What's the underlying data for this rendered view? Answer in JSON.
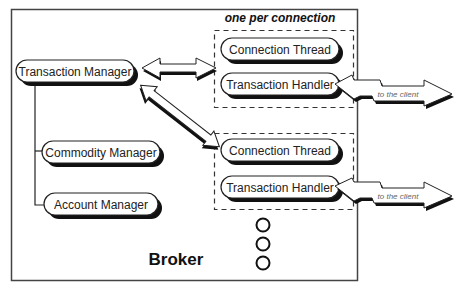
{
  "diagram": {
    "container": {
      "label": "Broker"
    },
    "group_label": "one per connection",
    "managers": [
      {
        "label": "Transaction Manager"
      },
      {
        "label": "Commodity Manager"
      },
      {
        "label": "Account Manager"
      }
    ],
    "connection_groups": [
      {
        "thread": "Connection Thread",
        "handler": "Transaction Handler",
        "client_arrow": "to the client"
      },
      {
        "thread": "Connection Thread",
        "handler": "Transaction Handler",
        "client_arrow": "to the client"
      }
    ],
    "ellipsis_count": 3,
    "edges": [
      {
        "from": "Transaction Manager",
        "to": "Connection Group 1",
        "type": "bidirectional"
      },
      {
        "from": "Transaction Manager",
        "to": "Connection Group 2",
        "type": "bidirectional"
      },
      {
        "from": "Transaction Manager",
        "to": "Commodity Manager",
        "type": "tree"
      },
      {
        "from": "Transaction Manager",
        "to": "Account Manager",
        "type": "tree"
      },
      {
        "from": "Transaction Handler 1",
        "to": "client",
        "type": "bidirectional"
      },
      {
        "from": "Transaction Handler 2",
        "to": "client",
        "type": "bidirectional"
      }
    ],
    "colors": {
      "stroke": "#222222",
      "shadow": "#111111",
      "background": "#ffffff",
      "dashed": "#333333"
    }
  }
}
